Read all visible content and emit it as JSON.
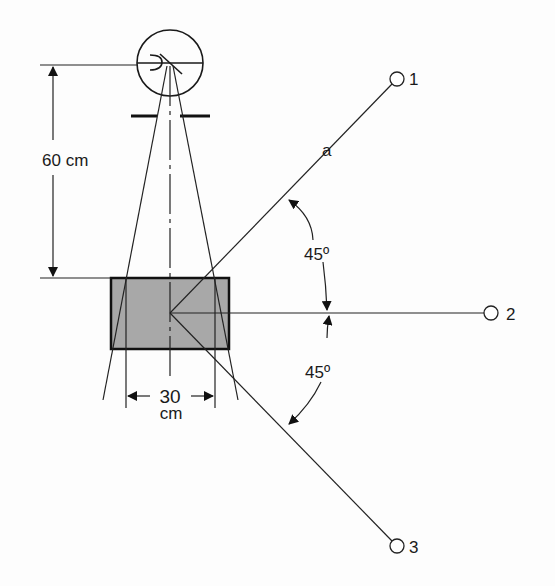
{
  "diagram": {
    "type": "radiography-geometry",
    "colors": {
      "line": "#1a1a1a",
      "phantom_fill": "#a6a6a6",
      "background": "#fdfdfd"
    },
    "source": {
      "label": "x-ray-tube",
      "center": [
        170,
        63
      ],
      "radius": 33
    },
    "distance_label": "60 cm",
    "width_label_value": "30",
    "width_label_unit": "cm",
    "phantom": {
      "x": 111,
      "y": 278,
      "width": 118,
      "height": 71
    },
    "ray_label": "a",
    "angles": {
      "upper": "45º",
      "lower": "45º"
    },
    "positions": [
      {
        "id": "1",
        "label": "1",
        "point": [
          397,
          79
        ]
      },
      {
        "id": "2",
        "label": "2",
        "point": [
          491,
          313
        ]
      },
      {
        "id": "3",
        "label": "3",
        "point": [
          397,
          546
        ]
      }
    ]
  }
}
